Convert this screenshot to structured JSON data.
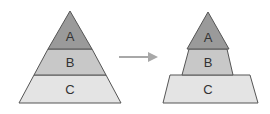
{
  "diagram": {
    "left_pyramid": {
      "layers": [
        {
          "label": "A",
          "color": "#9a9a9a"
        },
        {
          "label": "B",
          "color": "#c8c8c8"
        },
        {
          "label": "C",
          "color": "#e4e4e4"
        }
      ]
    },
    "right_pyramid": {
      "layers": [
        {
          "label": "A",
          "color": "#9a9a9a"
        },
        {
          "label": "B",
          "color": "#c8c8c8"
        },
        {
          "label": "C",
          "color": "#e4e4e4"
        }
      ]
    },
    "arrow": {
      "direction": "right",
      "color": "#a8a8a8"
    },
    "stroke_color": "#555555"
  }
}
